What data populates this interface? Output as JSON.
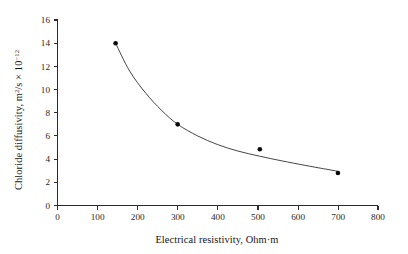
{
  "chart_data": {
    "type": "scatter",
    "title": "",
    "xlabel": "Electrical resistivity, Ohm·m",
    "ylabel_parts": {
      "main": "Chloride diffusivity, m",
      "sup1": "2",
      "mid": "/s × 10",
      "sup2": "−12"
    },
    "ylabel": "Chloride diffusivity, m2/s × 10−12",
    "x": [
      145,
      300,
      505,
      700
    ],
    "values": [
      14.0,
      7.0,
      4.85,
      2.8
    ],
    "points": [
      {
        "x": 145,
        "y": 14.0
      },
      {
        "x": 300,
        "y": 7.0
      },
      {
        "x": 505,
        "y": 4.85
      },
      {
        "x": 700,
        "y": 2.8
      }
    ],
    "fit_curve": {
      "description": "decreasing power-law fit through scatter points",
      "x": [
        145,
        180,
        220,
        260,
        300,
        350,
        400,
        450,
        505,
        560,
        620,
        700
      ],
      "y": [
        14.0,
        11.6,
        9.7,
        8.2,
        7.0,
        6.0,
        5.25,
        4.7,
        4.25,
        3.85,
        3.45,
        2.95
      ]
    },
    "xlim": [
      0,
      800
    ],
    "ylim": [
      0,
      16
    ],
    "xticks": [
      0,
      100,
      200,
      300,
      400,
      500,
      600,
      700,
      800
    ],
    "yticks": [
      0,
      2,
      4,
      6,
      8,
      10,
      12,
      14,
      16
    ],
    "xtick_labels": [
      "0",
      "100",
      "200",
      "300",
      "400",
      "500",
      "600",
      "700",
      "800"
    ],
    "ytick_labels": [
      "0",
      "2",
      "4",
      "6",
      "8",
      "10",
      "12",
      "14",
      "16"
    ],
    "grid": false,
    "legend": null,
    "marker_color": "#0a0a0a",
    "curve_color": "#3a3a3a",
    "axis_color": "#2b2b2b",
    "background_color": "#ffffff"
  }
}
